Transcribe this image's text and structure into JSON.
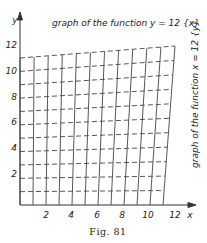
{
  "figure": {
    "caption": "Fig. 81",
    "top_label": "graph of the function y = 12 {x}",
    "right_label": "graph of the function x = 12 {y}",
    "x_axis_label": "x",
    "y_axis_label": "y",
    "x_ticks": [
      "2",
      "4",
      "6",
      "8",
      "10",
      "12"
    ],
    "y_ticks": [
      "2",
      "4",
      "6",
      "8",
      "10",
      "12"
    ],
    "line_color": "#333333"
  },
  "chart_data": {
    "type": "line",
    "title": "",
    "xlabel": "x",
    "ylabel": "y",
    "xlim": [
      0,
      13
    ],
    "ylim": [
      0,
      13
    ],
    "x_ticks": [
      2,
      4,
      6,
      8,
      10,
      12
    ],
    "y_ticks": [
      2,
      4,
      6,
      8,
      10,
      12
    ],
    "annotations": [
      "graph of the function y = 12 {x}",
      "graph of the function x = 12 {y}"
    ]
  }
}
